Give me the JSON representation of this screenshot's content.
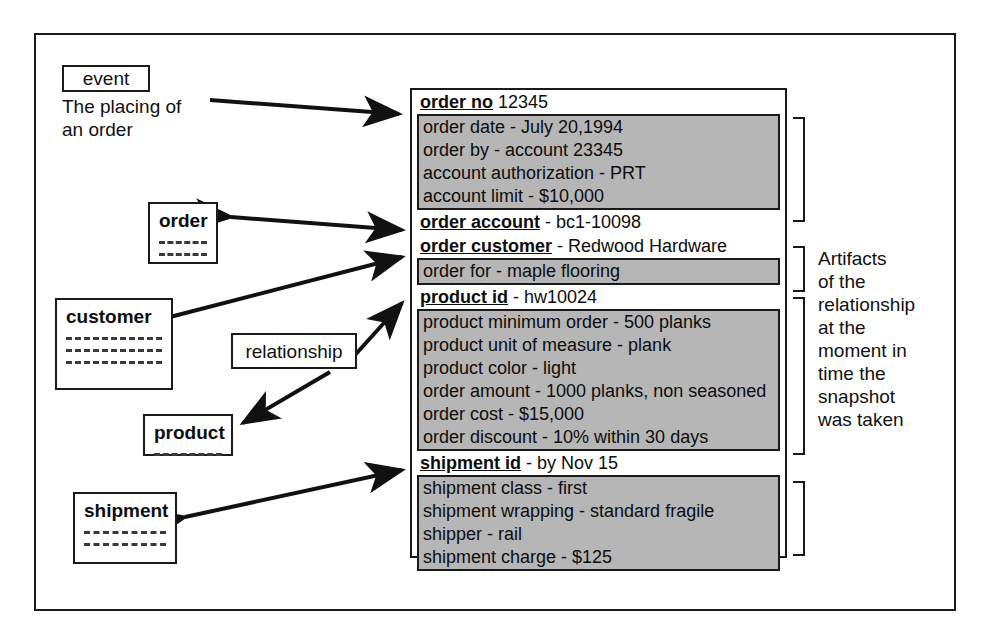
{
  "diagram": {
    "event_tag": "event",
    "event_caption": "The placing of\nan order",
    "relationship_tag": "relationship",
    "artifact_note": "Artifacts\nof the\nrelationship\nat the\nmoment in\ntime the\nsnapshot\nwas taken",
    "colors": {
      "ink": "#1a1a1a",
      "attribute_fill": "#b6b6b6",
      "paper": "#ffffff"
    }
  },
  "entities": [
    {
      "name": "order",
      "rules": 2
    },
    {
      "name": "customer",
      "rules": 3
    },
    {
      "name": "product",
      "rules": 1
    },
    {
      "name": "shipment",
      "rules": 2
    }
  ],
  "snapshot": {
    "groups": [
      {
        "id": "order-no",
        "key_bold": "order no",
        "key_rest": " 12345",
        "attributes": [
          "order date - July 20,1994",
          "order by - account 23345",
          "account authorization - PRT",
          "account limit - $10,000"
        ]
      },
      {
        "id": "order-account",
        "key_bold": "order account",
        "key_rest": " - bc1-10098",
        "attributes": []
      },
      {
        "id": "order-customer",
        "key_bold": "order customer",
        "key_rest": " - Redwood Hardware",
        "attributes": [
          "order for - maple flooring"
        ]
      },
      {
        "id": "product-id",
        "key_bold": "product id",
        "key_rest": " - hw10024",
        "attributes": [
          "product minimum order - 500 planks",
          "product unit of measure - plank",
          "product color - light",
          "order amount - 1000 planks, non seasoned",
          "order cost - $15,000",
          "order discount - 10% within 30 days"
        ]
      },
      {
        "id": "shipment-id",
        "key_bold": "shipment id",
        "key_rest": " -  by Nov 15",
        "attributes": [
          "shipment class - first",
          "shipment wrapping - standard fragile",
          "shipper - rail",
          "shipment charge - $125"
        ]
      }
    ]
  }
}
